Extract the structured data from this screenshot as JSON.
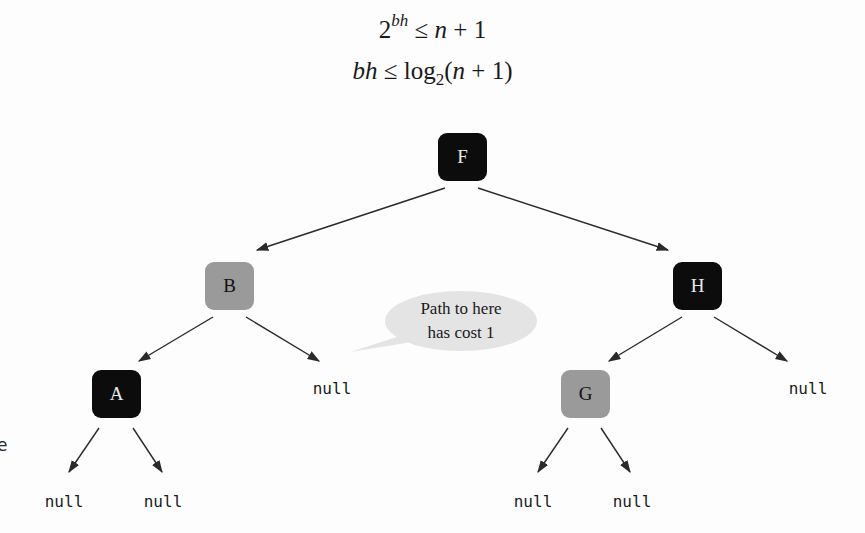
{
  "formulas": {
    "line1": {
      "base": "2",
      "exponent": "bh",
      "relation": "≤",
      "rhs_var": "n",
      "rhs_rest": " + 1"
    },
    "line2": {
      "lhs": "bh",
      "relation": "≤",
      "func": "log",
      "sub": "2",
      "arg_open": "(",
      "arg_var": "n",
      "arg_rest": " + 1)"
    }
  },
  "tree": {
    "nodes": [
      {
        "id": "F",
        "label": "F",
        "color": "black",
        "x": 438,
        "y": 133
      },
      {
        "id": "B",
        "label": "B",
        "color": "gray",
        "x": 205,
        "y": 262
      },
      {
        "id": "H",
        "label": "H",
        "color": "black",
        "x": 673,
        "y": 262
      },
      {
        "id": "A",
        "label": "A",
        "color": "black",
        "x": 92,
        "y": 370
      },
      {
        "id": "G",
        "label": "G",
        "color": "gray",
        "x": 561,
        "y": 370
      }
    ],
    "nulls": [
      {
        "label": "null",
        "parent": "B",
        "side": "right",
        "x": 332,
        "y": 379
      },
      {
        "label": "null",
        "parent": "H",
        "side": "right",
        "x": 808,
        "y": 379
      },
      {
        "label": "null",
        "parent": "A",
        "side": "left",
        "x": 64,
        "y": 492
      },
      {
        "label": "null",
        "parent": "A",
        "side": "right",
        "x": 163,
        "y": 492
      },
      {
        "label": "null",
        "parent": "G",
        "side": "left",
        "x": 533,
        "y": 492
      },
      {
        "label": "null",
        "parent": "G",
        "side": "right",
        "x": 632,
        "y": 492
      }
    ],
    "edges": [
      [
        "F",
        "B"
      ],
      [
        "F",
        "H"
      ],
      [
        "B",
        "A"
      ],
      [
        "B",
        "null-right"
      ],
      [
        "H",
        "G"
      ],
      [
        "H",
        "null-right"
      ],
      [
        "A",
        "null-left"
      ],
      [
        "A",
        "null-right"
      ],
      [
        "G",
        "null-left"
      ],
      [
        "G",
        "null-right"
      ]
    ]
  },
  "callout": {
    "line1": "Path to here",
    "line2": "has cost 1"
  },
  "edge_fragment": "e",
  "colors": {
    "black_node": "#0c0c0c",
    "gray_node": "#9a9a9a",
    "callout_fill": "#e4e4e4",
    "edge": "#2a2a2a"
  }
}
